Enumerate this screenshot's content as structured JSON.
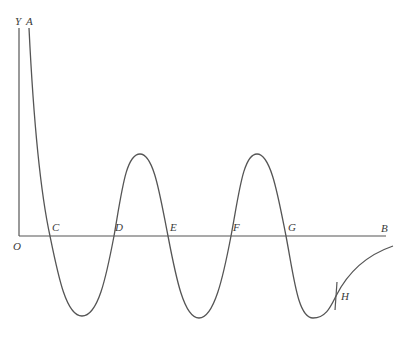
{
  "figure": {
    "type": "oscillating-curve-diagram",
    "stroke_color": "#555555",
    "label_color": "#3a3a3a",
    "labels": {
      "Y": "Y",
      "A": "A",
      "O": "O",
      "C": "C",
      "D": "D",
      "E": "E",
      "F": "F",
      "G": "G",
      "B": "B",
      "H": "H"
    },
    "axes": {
      "y_axis": {
        "x": 19,
        "y_top": 28,
        "y_bottom": 236
      },
      "x_axis": {
        "y": 236,
        "x_start": 19,
        "x_end": 386
      }
    },
    "axis_crossings": [
      {
        "label": "C",
        "x": 50
      },
      {
        "label": "D",
        "x": 114
      },
      {
        "label": "E",
        "x": 168
      },
      {
        "label": "F",
        "x": 231
      },
      {
        "label": "G",
        "x": 286
      }
    ],
    "peaks": [
      {
        "x": 140,
        "y": 154
      },
      {
        "x": 257,
        "y": 154
      }
    ],
    "troughs": [
      {
        "x": 82,
        "y": 316
      },
      {
        "x": 199,
        "y": 318
      },
      {
        "x": 313,
        "y": 318
      }
    ],
    "tangent_at_H": {
      "x": 336,
      "y_top": 282,
      "y_bottom": 310
    }
  }
}
